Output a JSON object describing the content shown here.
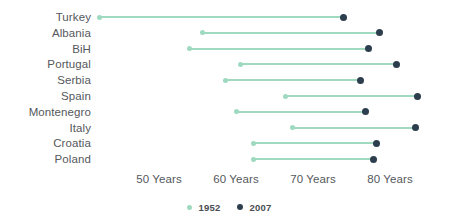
{
  "chart_data": {
    "type": "bar",
    "subtype": "dumbbell",
    "title": "",
    "subtitle": "",
    "xlabel": "",
    "ylabel": "",
    "grid": false,
    "legend_position": "bottom-center",
    "xlim": [
      42,
      85
    ],
    "x_tick_values": [
      50,
      60,
      70,
      80
    ],
    "x_tick_labels": [
      "50 Years",
      "60 Years",
      "70 Years",
      "80 Years"
    ],
    "categories": [
      "Turkey",
      "Albania",
      "BiH",
      "Portugal",
      "Serbia",
      "Spain",
      "Montenegro",
      "Italy",
      "Croatia",
      "Poland"
    ],
    "series": [
      {
        "name": "1952",
        "color": "#9ed9c0",
        "values": [
          42.3,
          55.6,
          54.0,
          60.6,
          58.7,
          66.4,
          60.1,
          67.4,
          62.3,
          62.3
        ]
      },
      {
        "name": "2007",
        "color": "#2d3e4e",
        "values": [
          73.9,
          78.6,
          77.2,
          80.8,
          76.2,
          83.6,
          76.8,
          83.3,
          78.2,
          77.9
        ]
      }
    ],
    "connector_color": "#9ed9c0"
  },
  "legend": {
    "items": [
      {
        "label": "1952",
        "color": "#9ed9c0"
      },
      {
        "label": "2007",
        "color": "#2d3e4e"
      }
    ]
  }
}
